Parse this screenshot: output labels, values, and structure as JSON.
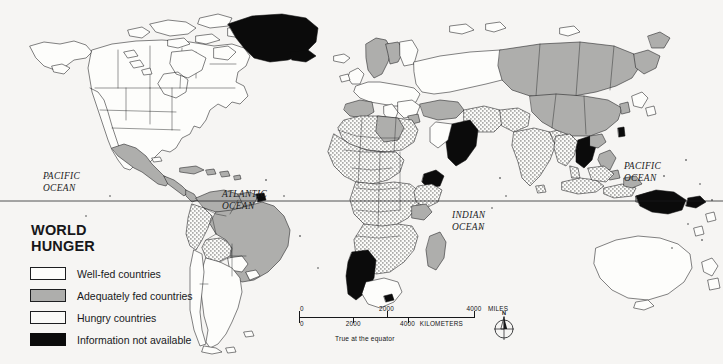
{
  "map": {
    "title": "WORLD\nHUNGER",
    "projection_note": "True at the equator",
    "background_color": "#f6f5f3",
    "ink_color": "#17181a"
  },
  "legend": {
    "title": "WORLD\nHUNGER",
    "items": [
      {
        "label": "Well-fed countries",
        "class": "well-fed",
        "color": "#fdfdfb",
        "swatch": "outline-white"
      },
      {
        "label": "Adequately fed countries",
        "class": "adequate",
        "color": "#aeaeac",
        "swatch": "solid-gray"
      },
      {
        "label": "Hungry countries",
        "class": "hungry",
        "color": "#fafaf8",
        "swatch": "stipple-dots"
      },
      {
        "label": "Information not available",
        "class": "nodata",
        "color": "#0b0b0b",
        "swatch": "solid-black"
      }
    ]
  },
  "ocean_labels": [
    {
      "name": "pacific-west",
      "text": "PACIFIC\nOCEAN"
    },
    {
      "name": "atlantic",
      "text": "ATLANTIC\nOCEAN"
    },
    {
      "name": "indian",
      "text": "INDIAN\nOCEAN"
    },
    {
      "name": "pacific-east",
      "text": "PACIFIC\nOCEAN"
    }
  ],
  "scalebar": {
    "miles": {
      "unit": "MILES",
      "ticks": [
        {
          "value": "0",
          "pos_pct": 0
        },
        {
          "value": "2000",
          "pos_pct": 50
        },
        {
          "value": "4000",
          "pos_pct": 100
        }
      ]
    },
    "kilometers": {
      "unit": "KILOMETERS",
      "ticks": [
        {
          "value": "0",
          "pos_pct": 0
        },
        {
          "value": "2000",
          "pos_pct": 31
        },
        {
          "value": "4000",
          "pos_pct": 62
        }
      ]
    },
    "note": "True at the equator"
  },
  "compass": {
    "north_letter": "N",
    "name": "compass-rose"
  },
  "equator": {
    "name": "equator-line",
    "y": 201
  }
}
